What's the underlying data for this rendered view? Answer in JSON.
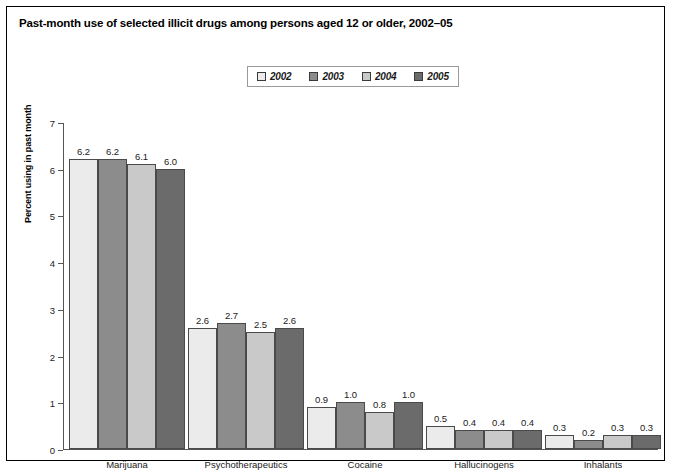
{
  "chart_title": "Past-month use of selected illicit drugs among persons aged 12 or older, 2002–05",
  "legend": {
    "entries": [
      {
        "label": "2002",
        "color": "#ebebeb"
      },
      {
        "label": "2003",
        "color": "#8c8c8c"
      },
      {
        "label": "2004",
        "color": "#c9c9c9"
      },
      {
        "label": "2005",
        "color": "#6b6b6b"
      }
    ]
  },
  "axis": {
    "y_title": "Percent using in past month",
    "y_ticks": [
      "0",
      "1",
      "2",
      "3",
      "4",
      "5",
      "6",
      "7"
    ]
  },
  "chart_data": {
    "type": "bar",
    "title": "Past-month use of selected illicit drugs among persons aged 12 or older, 2002–05",
    "xlabel": "",
    "ylabel": "Percent using in past month",
    "ylim": [
      0,
      7
    ],
    "yticks": [
      0,
      1,
      2,
      3,
      4,
      5,
      6,
      7
    ],
    "grid": false,
    "legend_position": "top-center",
    "categories": [
      "Marijuana",
      "Psychotherapeutics",
      "Cocaine",
      "Hallucinogens",
      "Inhalants"
    ],
    "series": [
      {
        "name": "2002",
        "color": "#ebebeb",
        "values": [
          6.2,
          2.6,
          0.9,
          0.5,
          0.3
        ],
        "labels": [
          "6.2",
          "2.6",
          "0.9",
          "0.5",
          "0.3"
        ]
      },
      {
        "name": "2003",
        "color": "#8c8c8c",
        "values": [
          6.2,
          2.7,
          1.0,
          0.4,
          0.2
        ],
        "labels": [
          "6.2",
          "2.7",
          "1.0",
          "0.4",
          "0.2"
        ]
      },
      {
        "name": "2004",
        "color": "#c9c9c9",
        "values": [
          6.1,
          2.5,
          0.8,
          0.4,
          0.3
        ],
        "labels": [
          "6.1",
          "2.5",
          "0.8",
          "0.4",
          "0.3"
        ]
      },
      {
        "name": "2005",
        "color": "#6b6b6b",
        "values": [
          6.0,
          2.6,
          1.0,
          0.4,
          0.3
        ],
        "labels": [
          "6.0",
          "2.6",
          "1.0",
          "0.4",
          "0.3"
        ]
      }
    ]
  }
}
